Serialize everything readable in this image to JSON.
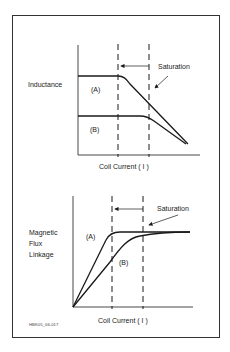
{
  "figure_id": "HBK05_06-017",
  "top_graph": {
    "ylabel": "Inductance",
    "xlabel": "Coil Current ( I )",
    "annotation": "Saturation",
    "curve_a_label": "(A)",
    "curve_b_label": "(B)"
  },
  "bottom_graph": {
    "ylabel_lines": [
      "Magnetic",
      "Flux",
      "Linkage"
    ],
    "xlabel": "Coil Current ( I )",
    "annotation": "Saturation",
    "curve_a_label": "(A)",
    "curve_b_label": "(B)"
  },
  "colors": {
    "line": "#1a1a1a",
    "frame": "#333333",
    "text": "#222222"
  }
}
